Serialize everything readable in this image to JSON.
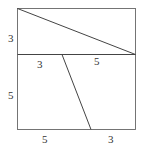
{
  "diagram": {
    "type": "geometry-figure",
    "colors": {
      "stroke": "#444444",
      "label": "#333333",
      "background": "#ffffff"
    },
    "square": {
      "x1": 17.5,
      "y1": 8.5,
      "x2": 135.5,
      "y2": 129.5
    },
    "divider": {
      "x1": 17.5,
      "y1": 54.5,
      "x2": 135.5,
      "y2": 54.5
    },
    "diagonal": {
      "x1": 17.5,
      "y1": 8.5,
      "x2": 135.5,
      "y2": 54.5
    },
    "slant": {
      "x1": 62,
      "y1": 54.5,
      "x2": 91,
      "y2": 129.5
    },
    "labels": {
      "left_top": "3",
      "mid_left": "3",
      "mid_right": "5",
      "left_bottom": "5",
      "bottom_left": "5",
      "bottom_right": "3"
    }
  }
}
